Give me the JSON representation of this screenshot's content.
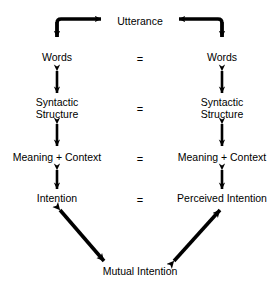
{
  "diagram": {
    "background_color": "#ffffff",
    "stroke_color": "#000000",
    "text_color": "#000000",
    "top_node": {
      "label": "Utterance",
      "x": 140,
      "y": 22
    },
    "bottom_node": {
      "label": "Mutual Intention",
      "x": 140,
      "y": 272
    },
    "left_column": [
      {
        "label": "Words",
        "x": 57,
        "y": 58
      },
      {
        "label": "Syntactic\nStructure",
        "x": 57,
        "y": 108
      },
      {
        "label": "Meaning + Context",
        "x": 57,
        "y": 158
      },
      {
        "label": "Intention",
        "x": 57,
        "y": 199
      }
    ],
    "right_column": [
      {
        "label": "Words",
        "x": 222,
        "y": 58
      },
      {
        "label": "Syntactic\nStructure",
        "x": 222,
        "y": 108
      },
      {
        "label": "Meaning + Context",
        "x": 222,
        "y": 158
      },
      {
        "label": "Perceived Intention",
        "x": 222,
        "y": 199
      }
    ],
    "equals_signs": [
      {
        "label": "=",
        "x": 140,
        "y": 58
      },
      {
        "label": "=",
        "x": 140,
        "y": 108
      },
      {
        "label": "=",
        "x": 140,
        "y": 158
      },
      {
        "label": "=",
        "x": 140,
        "y": 199
      }
    ],
    "connectors": {
      "top_left_elbow": "words-to-utterance-elbow-arrow",
      "top_right_elbow": "utterance-to-words-elbow-arrow",
      "left_vertical": [
        "words-syntactic",
        "syntactic-meaning",
        "meaning-intention"
      ],
      "right_vertical": [
        "words-syntactic",
        "syntactic-meaning",
        "meaning-perceived-intention"
      ],
      "bottom_left_diagonal": "intention-to-mutual-intention-arrow",
      "bottom_right_diagonal": "mutual-intention-to-perceived-intention-arrow"
    }
  }
}
